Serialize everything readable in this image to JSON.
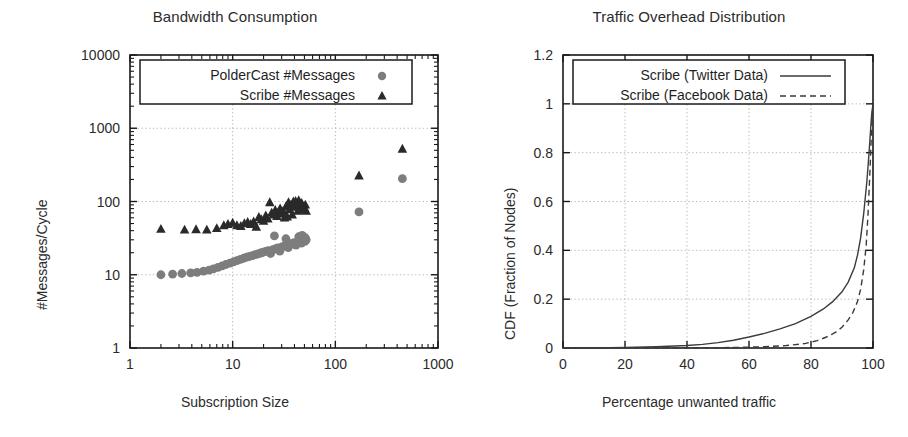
{
  "figure": {
    "background": "#ffffff"
  },
  "panels": [
    {
      "id": "bandwidth-consumption",
      "title": "Bandwidth Consumption",
      "xlabel": "Subscription Size",
      "ylabel": "#Messages/Cycle"
    },
    {
      "id": "traffic-overhead",
      "title": "Traffic Overhead Distribution",
      "xlabel": "Percentage unwanted traffic",
      "ylabel": "CDF (Fraction of Nodes)"
    }
  ],
  "chart_data": [
    {
      "type": "scatter",
      "title": "Bandwidth Consumption",
      "xlabel": "Subscription Size",
      "ylabel": "#Messages/Cycle",
      "xscale": "log",
      "yscale": "log",
      "xlim": [
        1,
        1000
      ],
      "ylim": [
        1,
        10000
      ],
      "xticks": [
        1,
        10,
        100,
        1000
      ],
      "xticklabels": [
        "1",
        "10",
        "100",
        "1000"
      ],
      "yticks": [
        1,
        10,
        100,
        1000,
        10000
      ],
      "yticklabels": [
        "1",
        "10",
        "100",
        "1000",
        "10000"
      ],
      "grid": true,
      "legend_position": "top-center",
      "series": [
        {
          "name": "PolderCast #Messages",
          "marker": "circle",
          "color": "#7d7d7d",
          "points": [
            [
              2.0,
              10.0
            ],
            [
              2.6,
              10.2
            ],
            [
              3.2,
              10.4
            ],
            [
              3.9,
              10.6
            ],
            [
              4.5,
              10.8
            ],
            [
              5.2,
              11.2
            ],
            [
              5.9,
              11.6
            ],
            [
              6.5,
              12.0
            ],
            [
              7.2,
              12.6
            ],
            [
              7.9,
              13.2
            ],
            [
              8.6,
              13.8
            ],
            [
              9.4,
              14.4
            ],
            [
              10.2,
              15.0
            ],
            [
              11.0,
              15.6
            ],
            [
              11.9,
              16.2
            ],
            [
              12.8,
              16.8
            ],
            [
              13.7,
              17.4
            ],
            [
              14.6,
              17.8
            ],
            [
              15.6,
              18.3
            ],
            [
              16.6,
              18.8
            ],
            [
              17.6,
              19.2
            ],
            [
              18.7,
              19.8
            ],
            [
              19.8,
              20.3
            ],
            [
              21.0,
              20.8
            ],
            [
              22.2,
              21.3
            ],
            [
              23.4,
              19.5
            ],
            [
              24.7,
              22.0
            ],
            [
              26.0,
              22.6
            ],
            [
              27.4,
              23.2
            ],
            [
              28.8,
              21.0
            ],
            [
              30.2,
              24.0
            ],
            [
              31.7,
              24.6
            ],
            [
              33.2,
              25.2
            ],
            [
              34.8,
              23.5
            ],
            [
              36.4,
              26.0
            ],
            [
              38.0,
              26.8
            ],
            [
              39.7,
              27.5
            ],
            [
              41.4,
              25.4
            ],
            [
              43.2,
              28.2
            ],
            [
              45.0,
              29.0
            ],
            [
              46.8,
              27.0
            ],
            [
              48.0,
              29.8
            ],
            [
              49.5,
              30.5
            ],
            [
              50.5,
              28.5
            ],
            [
              52.0,
              30.0
            ],
            [
              25.5,
              34.0
            ],
            [
              33.0,
              31.0
            ],
            [
              44.0,
              33.0
            ],
            [
              47.5,
              34.5
            ],
            [
              51.0,
              32.0
            ],
            [
              170.0,
              72.0
            ],
            [
              450.0,
              205.0
            ]
          ]
        },
        {
          "name": "Scribe #Messages",
          "marker": "triangle",
          "color": "#2a2a2a",
          "points": [
            [
              2.0,
              42.0
            ],
            [
              3.4,
              41.0
            ],
            [
              4.4,
              41.5
            ],
            [
              5.6,
              41.0
            ],
            [
              7.0,
              43.0
            ],
            [
              8.2,
              47.0
            ],
            [
              9.0,
              49.0
            ],
            [
              10.0,
              51.0
            ],
            [
              11.0,
              47.0
            ],
            [
              12.0,
              46.0
            ],
            [
              13.0,
              50.0
            ],
            [
              14.0,
              52.0
            ],
            [
              15.0,
              49.0
            ],
            [
              16.0,
              53.0
            ],
            [
              17.0,
              45.0
            ],
            [
              18.0,
              61.0
            ],
            [
              19.0,
              57.0
            ],
            [
              20.0,
              54.0
            ],
            [
              21.0,
              64.0
            ],
            [
              22.0,
              58.0
            ],
            [
              23.0,
              97.0
            ],
            [
              24.0,
              70.0
            ],
            [
              25.0,
              66.0
            ],
            [
              26.0,
              76.0
            ],
            [
              27.0,
              63.0
            ],
            [
              28.0,
              72.0
            ],
            [
              29.0,
              80.0
            ],
            [
              30.0,
              68.0
            ],
            [
              31.0,
              74.0
            ],
            [
              32.0,
              60.0
            ],
            [
              33.0,
              85.0
            ],
            [
              34.0,
              62.0
            ],
            [
              35.0,
              97.0
            ],
            [
              36.0,
              78.0
            ],
            [
              37.0,
              90.0
            ],
            [
              38.0,
              66.0
            ],
            [
              39.0,
              99.0
            ],
            [
              40.0,
              84.0
            ],
            [
              41.0,
              101.0
            ],
            [
              42.0,
              92.0
            ],
            [
              43.0,
              74.0
            ],
            [
              44.0,
              103.0
            ],
            [
              45.0,
              88.0
            ],
            [
              46.0,
              80.0
            ],
            [
              47.0,
              95.0
            ],
            [
              48.0,
              86.0
            ],
            [
              49.0,
              78.0
            ],
            [
              50.0,
              82.0
            ],
            [
              51.0,
              90.0
            ],
            [
              52.0,
              74.0
            ],
            [
              170.0,
              225.0
            ],
            [
              450.0,
              520.0
            ]
          ]
        }
      ]
    },
    {
      "type": "line",
      "title": "Traffic Overhead Distribution",
      "xlabel": "Percentage unwanted traffic",
      "ylabel": "CDF (Fraction of Nodes)",
      "xlim": [
        0,
        100
      ],
      "ylim": [
        0,
        1.2
      ],
      "xticks": [
        0,
        20,
        40,
        60,
        80,
        100
      ],
      "xticklabels": [
        "0",
        "20",
        "40",
        "60",
        "80",
        "100"
      ],
      "yticks": [
        0,
        0.2,
        0.4,
        0.6,
        0.8,
        1,
        1.2
      ],
      "yticklabels": [
        "0",
        "0.2",
        "0.4",
        "0.6",
        "0.8",
        "1",
        "1.2"
      ],
      "grid": true,
      "legend_position": "top-center",
      "series": [
        {
          "name": "Scribe (Twitter Data)",
          "style": "solid",
          "color": "#3b3b3b",
          "x": [
            0,
            10,
            20,
            30,
            40,
            45,
            50,
            55,
            60,
            65,
            70,
            75,
            80,
            84,
            87,
            90,
            92,
            94,
            95,
            96,
            97,
            98,
            98.5,
            99,
            99.3,
            99.6,
            100
          ],
          "y": [
            0.0,
            0.0,
            0.002,
            0.005,
            0.01,
            0.015,
            0.022,
            0.032,
            0.045,
            0.06,
            0.078,
            0.1,
            0.13,
            0.16,
            0.19,
            0.23,
            0.27,
            0.33,
            0.38,
            0.45,
            0.55,
            0.68,
            0.76,
            0.85,
            0.91,
            0.96,
            1.0
          ]
        },
        {
          "name": "Scribe (Facebook Data)",
          "style": "dashed",
          "color": "#3b3b3b",
          "x": [
            0,
            20,
            40,
            55,
            65,
            72,
            78,
            82,
            85,
            88,
            90,
            92,
            93.5,
            95,
            96,
            97,
            97.8,
            98.4,
            99,
            99.4,
            99.7,
            100
          ],
          "y": [
            0.0,
            0.0,
            0.0,
            0.002,
            0.005,
            0.01,
            0.018,
            0.03,
            0.045,
            0.065,
            0.085,
            0.115,
            0.145,
            0.19,
            0.24,
            0.32,
            0.42,
            0.55,
            0.72,
            0.85,
            0.94,
            1.0
          ]
        }
      ]
    }
  ]
}
